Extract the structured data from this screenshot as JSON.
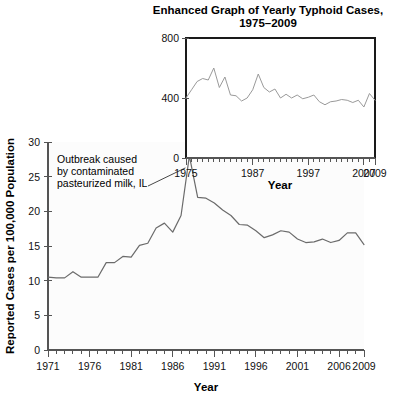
{
  "figure": {
    "background_color": "#ffffff",
    "line_color": "#6b6b6b",
    "inset_line_color": "#9a9a9a",
    "axis_color": "#555555"
  },
  "inset": {
    "title_line1": "Enhanced Graph of Yearly Typhoid Cases,",
    "title_line2": "1975–2009",
    "xlabel": "Year",
    "ytick_labels": [
      "0",
      "400",
      "800"
    ],
    "xtick_labels": [
      "1975",
      "1987",
      "1997",
      "2007",
      "2009"
    ]
  },
  "main": {
    "xlabel": "Year",
    "ylabel": "Reported Cases per 100,000 Population",
    "ytick_labels": [
      "0",
      "5",
      "10",
      "15",
      "20",
      "25",
      "30"
    ],
    "xtick_labels": [
      "1971",
      "1976",
      "1981",
      "1986",
      "1991",
      "1996",
      "2001",
      "2006",
      "2009"
    ],
    "annotation": {
      "line1": "Outbreak caused",
      "line2": "by contaminated",
      "line3": "pasteurized milk, IL"
    }
  },
  "chart_data": [
    {
      "type": "line",
      "name": "main-chart",
      "title": "",
      "xlabel": "Year",
      "ylabel": "Reported Cases per 100,000 Population",
      "xlim": [
        1971,
        2009
      ],
      "ylim": [
        0,
        30
      ],
      "ytick_values": [
        0,
        5,
        10,
        15,
        20,
        25,
        30
      ],
      "xtick_values": [
        1971,
        1976,
        1981,
        1986,
        1991,
        1996,
        2001,
        2006,
        2009
      ],
      "grid": false,
      "legend": "none",
      "x": [
        1971,
        1972,
        1973,
        1974,
        1975,
        1976,
        1977,
        1978,
        1979,
        1980,
        1981,
        1982,
        1983,
        1984,
        1985,
        1986,
        1987,
        1988,
        1989,
        1990,
        1991,
        1992,
        1993,
        1994,
        1995,
        1996,
        1997,
        1998,
        1999,
        2000,
        2001,
        2002,
        2003,
        2004,
        2005,
        2006,
        2007,
        2008,
        2009
      ],
      "values": [
        10.5,
        10.4,
        10.4,
        11.3,
        10.5,
        10.5,
        10.5,
        12.6,
        12.6,
        13.5,
        13.4,
        15.1,
        15.4,
        17.6,
        18.3,
        17.0,
        19.4,
        28.0,
        22.0,
        21.9,
        21.2,
        20.2,
        19.4,
        18.1,
        18.0,
        17.2,
        16.2,
        16.6,
        17.2,
        17.0,
        16.0,
        15.5,
        15.6,
        16.0,
        15.5,
        15.8,
        16.9,
        16.9,
        15.2
      ],
      "annotations": [
        {
          "text": "Outbreak caused by contaminated pasteurized milk, IL",
          "target_x": 1988,
          "target_y": 28.0
        }
      ]
    },
    {
      "type": "line",
      "name": "inset-chart",
      "title": "Enhanced Graph of Yearly Typhoid Cases, 1975–2009",
      "xlabel": "Year",
      "ylabel": "",
      "xlim": [
        1975,
        2009
      ],
      "ylim": [
        0,
        800
      ],
      "ytick_values": [
        0,
        400,
        800
      ],
      "xtick_values": [
        1975,
        1987,
        1997,
        2007,
        2009
      ],
      "grid": false,
      "legend": "none",
      "x": [
        1975,
        1976,
        1977,
        1978,
        1979,
        1980,
        1981,
        1982,
        1983,
        1984,
        1985,
        1986,
        1987,
        1988,
        1989,
        1990,
        1991,
        1992,
        1993,
        1994,
        1995,
        1996,
        1997,
        1998,
        1999,
        2000,
        2001,
        2002,
        2003,
        2004,
        2005,
        2006,
        2007,
        2008,
        2009
      ],
      "values": [
        400,
        455,
        510,
        530,
        520,
        600,
        470,
        540,
        420,
        415,
        380,
        400,
        455,
        560,
        470,
        440,
        460,
        400,
        425,
        400,
        420,
        395,
        405,
        420,
        375,
        355,
        375,
        380,
        390,
        385,
        370,
        385,
        340,
        430,
        385
      ]
    }
  ]
}
